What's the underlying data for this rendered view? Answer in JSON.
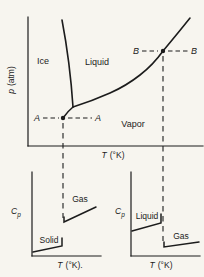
{
  "figure": {
    "bg": "#f7f5ef",
    "ink": "#1c1c1c"
  },
  "top_chart": {
    "ylabel_var": "p",
    "ylabel_units": "(atm)",
    "xlabel_var": "T",
    "xlabel_units": "(°K)",
    "region_ice": "Ice",
    "region_liquid": "Liquid",
    "region_vapor": "Vapor",
    "point_a_left": "A",
    "point_a_right": "A",
    "point_b_left": "B",
    "point_b_right": "B"
  },
  "bottom_left_chart": {
    "ylabel_var": "C",
    "ylabel_sub": "p",
    "xlabel_var": "T",
    "xlabel_units": "(°K).",
    "label_solid": "Solid",
    "label_gas": "Gas"
  },
  "bottom_right_chart": {
    "ylabel_var": "C",
    "ylabel_sub": "p",
    "xlabel_var": "T",
    "xlabel_units": "(°K)",
    "label_liquid": "Liquid",
    "label_gas": "Gas"
  },
  "geometry": {
    "top_y_axis": "M28,17 L28,146",
    "top_x_axis": "M28,146 L203,146",
    "fusion_curve": "M62,20 Q70,62 73,107",
    "vaporization_curve": "M73,107 Q92,101 110,93 Q126,86 140,75 Q153,65 163,51 Q178,33 190,18",
    "sublimation_curve": "M63,118 Q68,111 73,107",
    "a_point": "M60.8,118 a2.2,2.2 0 1 0 4.4,0 a2.2,2.2 0 1 0 -4.4,0",
    "b_point": "M160.8,51 a2.2,2.2 0 1 0 4.4,0 a2.2,2.2 0 1 0 -4.4,0",
    "a_dash_horizontal": "M43,118 L59,118 M68,118 L92,118",
    "b_dash_horizontal": "M142,51 L158,51 M168,51 L188,51",
    "a_dash_vertical": "M63,123 L63,218",
    "b_dash_vertical": "M163,56 L163,241",
    "bl_y_axis": "M32,172 L32,256",
    "bl_x_axis": "M32,256 L101,256",
    "bl_solid_line": "M33,252 L62,246 L62,238",
    "bl_gas_line": "M64,217 L64,222 L96,207",
    "br_y_axis": "M131,172 L131,256",
    "br_x_axis": "M131,256 L200,256",
    "br_liquid_line": "M132,231 L161,223 L161,214",
    "br_gas_line": "M164,242 L164,247 L199,242"
  },
  "chart_data": [
    {
      "type": "line",
      "title": "Phase diagram",
      "xlabel": "T (°K)",
      "ylabel": "p (atm)",
      "units": "fraction of plot area (schematic figure, axes have no numeric ticks)",
      "grid": false,
      "series": [
        {
          "name": "fusion curve (Ice–Liquid boundary)",
          "x": [
            0.2,
            0.26
          ],
          "y": [
            0.98,
            0.3
          ]
        },
        {
          "name": "vaporization curve (Liquid–Vapor boundary)",
          "x": [
            0.26,
            0.47,
            0.64,
            0.78,
            0.93
          ],
          "y": [
            0.3,
            0.41,
            0.55,
            0.74,
            0.99
          ]
        },
        {
          "name": "sublimation curve (Ice–Vapor boundary)",
          "x": [
            0.2,
            0.26
          ],
          "y": [
            0.22,
            0.3
          ]
        }
      ],
      "annotations": [
        {
          "label": "Ice",
          "type": "region"
        },
        {
          "label": "Liquid",
          "type": "region"
        },
        {
          "label": "Vapor",
          "type": "region"
        },
        {
          "label": "A",
          "type": "point",
          "x": 0.2,
          "y": 0.22,
          "note": "on sublimation curve; horizontal dashed A–A line and vertical dashed line down to lower-left Cp plot"
        },
        {
          "label": "B",
          "type": "point",
          "x": 0.78,
          "y": 0.74,
          "note": "on vaporization curve; horizontal dashed B–B line and vertical dashed line down to lower-right Cp plot"
        },
        {
          "type": "triple point",
          "x": 0.26,
          "y": 0.3
        }
      ]
    },
    {
      "type": "line",
      "title": "Cp across sublimation (constant pressure through A)",
      "xlabel": "T (°K).",
      "ylabel": "Cp",
      "units": "fraction of plot area (schematic)",
      "grid": false,
      "series": [
        {
          "name": "Solid",
          "x": [
            0.01,
            0.44
          ],
          "y": [
            0.07,
            0.14
          ],
          "end_tick_to_y": 0.24
        },
        {
          "name": "Gas",
          "x": [
            0.47,
            0.94
          ],
          "y": [
            0.42,
            0.59
          ]
        }
      ],
      "annotations": [
        {
          "type": "vertical dashed line at transition temperature",
          "x": 0.46,
          "note": "aligned with point A above; Cp jumps discontinuously upward from Solid to Gas"
        }
      ]
    },
    {
      "type": "line",
      "title": "Cp across vaporization (constant pressure through B)",
      "xlabel": "T (°K)",
      "ylabel": "Cp",
      "units": "fraction of plot area (schematic)",
      "grid": false,
      "series": [
        {
          "name": "Liquid",
          "x": [
            0.01,
            0.43
          ],
          "y": [
            0.31,
            0.4
          ],
          "end_tick_to_y": 0.5
        },
        {
          "name": "Gas",
          "x": [
            0.48,
            0.99
          ],
          "y": [
            0.11,
            0.17
          ]
        }
      ],
      "annotations": [
        {
          "type": "vertical dashed line at transition temperature",
          "x": 0.47,
          "note": "aligned with point B above; Cp drops discontinuously from Liquid to Gas"
        }
      ]
    }
  ]
}
